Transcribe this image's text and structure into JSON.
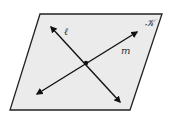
{
  "diagram": {
    "type": "geometry",
    "plane": {
      "label": "𝒦",
      "fill": "#ebebeb",
      "stroke": "#222222",
      "points": "40,14 162,14 130,110 10,110"
    },
    "lines": [
      {
        "name": "line-l",
        "label": "ℓ",
        "x1": 51,
        "y1": 27,
        "x2": 120,
        "y2": 102,
        "label_x": 65,
        "label_y": 35
      },
      {
        "name": "line-m",
        "label": "m",
        "x1": 37,
        "y1": 94,
        "x2": 137,
        "y2": 32,
        "label_x": 122,
        "label_y": 54
      }
    ],
    "intersection": {
      "x": 86,
      "y": 63
    },
    "colors": {
      "line": "#111111",
      "plane_fill": "#ebebeb",
      "plane_stroke": "#222222"
    }
  }
}
